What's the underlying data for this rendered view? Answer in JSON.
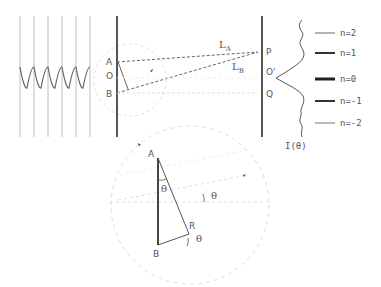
{
  "diagram": {
    "colors": {
      "ink": "#555555",
      "light_line": "#bbbbbb",
      "faint_dash": "#d6d6d6"
    },
    "incident_wave": {
      "wavefront_count": 6,
      "label": ""
    },
    "slit_screen": {
      "labels": {
        "A": "A",
        "O": "O",
        "B": "B"
      }
    },
    "detector_screen": {
      "labels": {
        "P": "P",
        "O_prime": "O'",
        "Q": "Q"
      }
    },
    "path_labels": {
      "LA_main": "L",
      "LA_sub": "A",
      "LB_main": "L",
      "LB_sub": "B"
    },
    "intensity": {
      "label": "I(θ)"
    },
    "orders": [
      {
        "label": "n=2",
        "weight": "thin"
      },
      {
        "label": "n=1",
        "weight": "thick"
      },
      {
        "label": "n=0",
        "weight": "thickest"
      },
      {
        "label": "n=-1",
        "weight": "thick"
      },
      {
        "label": "n=-2",
        "weight": "thin"
      }
    ],
    "zoom_inset": {
      "labels": {
        "A": "A",
        "B": "B",
        "R": "R",
        "theta_top": "θ",
        "theta_ray": "θ",
        "theta_bottom": "θ"
      }
    }
  }
}
